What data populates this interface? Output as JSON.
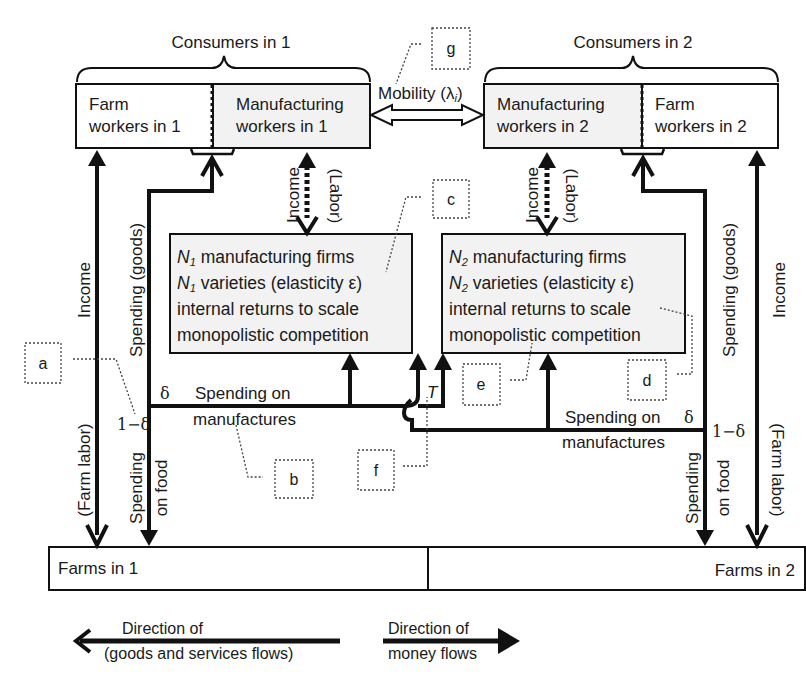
{
  "diagram": {
    "consumers": [
      {
        "title": "Consumers in 1",
        "farm_label_1": "Farm",
        "farm_label_2": "workers in 1",
        "manuf_label_1": "Manufacturing",
        "manuf_label_2": "workers in 1"
      },
      {
        "title": "Consumers in 2",
        "farm_label_1": "Farm",
        "farm_label_2": "workers in 2",
        "manuf_label_1": "Manufacturing",
        "manuf_label_2": "workers in 2"
      }
    ],
    "mobility": {
      "label": "Mobility (λ",
      "subscript": "i",
      "close": ")"
    },
    "firms": [
      {
        "line1_var": "N",
        "line1_sub": "1",
        "line1_rest": " manufacturing firms",
        "line2_var": "N",
        "line2_sub": "1",
        "line2_rest": " varieties (elasticity ε)",
        "line3": "internal returns to scale",
        "line4": "monopolistic competition"
      },
      {
        "line1_var": "N",
        "line1_sub": "2",
        "line1_rest": " manufacturing firms",
        "line2_var": "N",
        "line2_sub": "2",
        "line2_rest": " varieties (elasticity ε)",
        "line3": "internal returns to scale",
        "line4": "monopolistic competition"
      }
    ],
    "flows": {
      "income": "Income",
      "farm_labor": "(Farm labor)",
      "spending_goods": "Spending (goods)",
      "spending_food_1": "Spending",
      "spending_food_2": "on food",
      "income_short": "Income",
      "labor": "(Labor)",
      "spending_on": "Spending on",
      "manufactures": "manufactures",
      "delta": "δ",
      "one_minus_delta": "1−δ",
      "transport": "T"
    },
    "farms": {
      "left": "Farms in 1",
      "right": "Farms in 2"
    },
    "callouts": [
      "a",
      "b",
      "c",
      "d",
      "e",
      "f",
      "g"
    ],
    "legend": {
      "goods_1": "Direction of",
      "goods_2": "(goods and services flows)",
      "money_1": "Direction of",
      "money_2": "money flows"
    },
    "colors": {
      "box_fill": "#f2f2f2",
      "line": "#111111",
      "callout": "#444444"
    }
  }
}
